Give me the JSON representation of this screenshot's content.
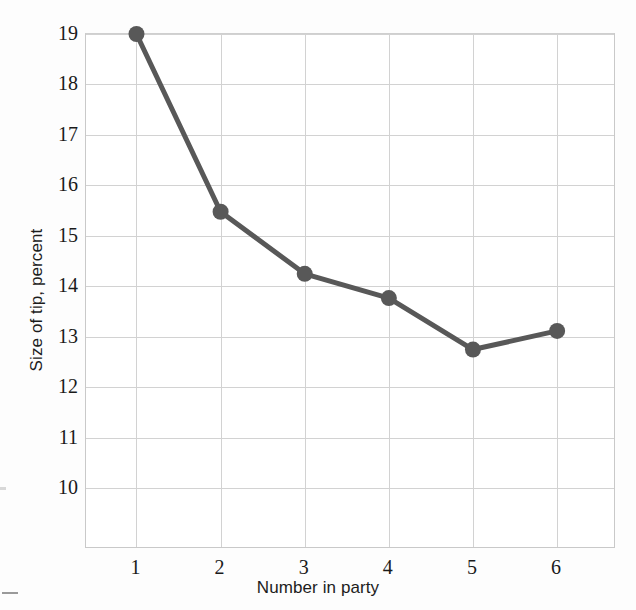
{
  "chart_data": {
    "type": "line",
    "title": "",
    "xlabel": "Number in party",
    "ylabel": "Size of tip, percent",
    "x": [
      1,
      2,
      3,
      4,
      5,
      6
    ],
    "values": [
      19.0,
      15.48,
      14.25,
      13.77,
      12.75,
      13.12
    ],
    "categories": [
      "1",
      "2",
      "3",
      "4",
      "5",
      "6"
    ],
    "xtick_labels": [
      "1",
      "2",
      "3",
      "4",
      "5",
      "6"
    ],
    "ytick_labels": [
      "19",
      "18",
      "17",
      "16",
      "15",
      "14",
      "13",
      "12",
      "11",
      "10"
    ],
    "ytick_values": [
      19,
      18,
      17,
      16,
      15,
      14,
      13,
      12,
      11,
      10
    ],
    "xlim": [
      0.4,
      6.7
    ],
    "ylim": [
      8.8,
      19.0
    ],
    "grid": true,
    "legend": false,
    "series": [
      {
        "name": "Size of tip, percent",
        "values": [
          19.0,
          15.48,
          14.25,
          13.77,
          12.75,
          13.12
        ]
      }
    ],
    "marker": "circle",
    "colors": {
      "line": "#585858",
      "marker": "#585858",
      "grid": "#d2d2d2",
      "axis": "#c9c9c9",
      "text": "#1a1a1a",
      "background": "#ffffff"
    }
  }
}
